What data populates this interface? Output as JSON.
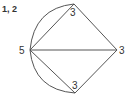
{
  "title": "1, 2",
  "graph": {
    "nodes": [
      {
        "id": "left",
        "label": "5"
      },
      {
        "id": "top",
        "label": "3"
      },
      {
        "id": "right",
        "label": "3"
      },
      {
        "id": "bottom",
        "label": "3"
      }
    ],
    "edges": [
      {
        "from": "left",
        "to": "top",
        "type": "straight"
      },
      {
        "from": "left",
        "to": "top",
        "type": "curved"
      },
      {
        "from": "left",
        "to": "right",
        "type": "straight"
      },
      {
        "from": "left",
        "to": "bottom",
        "type": "straight"
      },
      {
        "from": "left",
        "to": "bottom",
        "type": "curved"
      },
      {
        "from": "top",
        "to": "right",
        "type": "straight"
      },
      {
        "from": "bottom",
        "to": "right",
        "type": "straight"
      }
    ]
  }
}
